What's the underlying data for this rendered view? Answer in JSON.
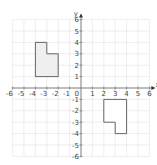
{
  "diagram": {
    "type": "coordinate-grid",
    "axes": {
      "x_label": "x",
      "y_label": "y",
      "x_range": [
        -6,
        6
      ],
      "y_range": [
        -6,
        6
      ],
      "origin_label": "0",
      "x_ticks": [
        "-6",
        "-5",
        "-4",
        "-3",
        "-2",
        "-1",
        "1",
        "2",
        "3",
        "4",
        "5",
        "6"
      ],
      "y_ticks": [
        "6",
        "5",
        "4",
        "3",
        "2",
        "1",
        "-1",
        "-2",
        "-3",
        "-4",
        "-5",
        "-6"
      ]
    },
    "shapes": [
      {
        "name": "shape-a",
        "fill": "#efefef",
        "stroke": "#666666",
        "vertices": [
          [
            -4,
            1
          ],
          [
            -4,
            4
          ],
          [
            -3,
            4
          ],
          [
            -3,
            3
          ],
          [
            -2,
            3
          ],
          [
            -2,
            1
          ]
        ]
      },
      {
        "name": "shape-b",
        "fill": "#ffffff",
        "stroke": "#666666",
        "vertices": [
          [
            2,
            -1
          ],
          [
            4,
            -1
          ],
          [
            4,
            -4
          ],
          [
            3,
            -4
          ],
          [
            3,
            -3
          ],
          [
            2,
            -3
          ]
        ]
      }
    ],
    "colors": {
      "grid": "#e2e2e2",
      "axis": "#777777"
    }
  }
}
